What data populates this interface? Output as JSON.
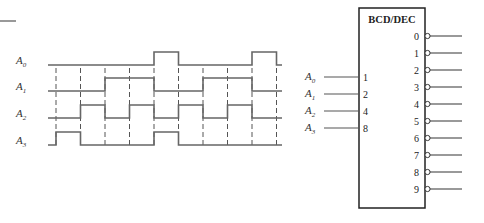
{
  "diagram": {
    "type": "timing-diagram-with-decoder",
    "timing": {
      "signals": [
        {
          "name": "A",
          "sub": "0",
          "label": "A0"
        },
        {
          "name": "A",
          "sub": "1",
          "label": "A1"
        },
        {
          "name": "A",
          "sub": "2",
          "label": "A2"
        },
        {
          "name": "A",
          "sub": "3",
          "label": "A3"
        }
      ],
      "slots": 9,
      "waveforms": {
        "A0": [
          0,
          0,
          0,
          0,
          1,
          0,
          0,
          0,
          1
        ],
        "A1": [
          0,
          0,
          1,
          1,
          0,
          0,
          1,
          1,
          0
        ],
        "A2": [
          0,
          1,
          0,
          1,
          0,
          1,
          0,
          1,
          0
        ],
        "A3": [
          1,
          0,
          0,
          0,
          1,
          0,
          0,
          0,
          0
        ]
      }
    },
    "decoder": {
      "title": "BCD/DEC",
      "inputs": [
        {
          "signal": "A",
          "sub": "0",
          "weight": "1"
        },
        {
          "signal": "A",
          "sub": "1",
          "weight": "2"
        },
        {
          "signal": "A",
          "sub": "2",
          "weight": "4"
        },
        {
          "signal": "A",
          "sub": "3",
          "weight": "8"
        }
      ],
      "outputs": [
        "0",
        "1",
        "2",
        "3",
        "4",
        "5",
        "6",
        "7",
        "8",
        "9"
      ],
      "outputs_active_low": true
    }
  }
}
